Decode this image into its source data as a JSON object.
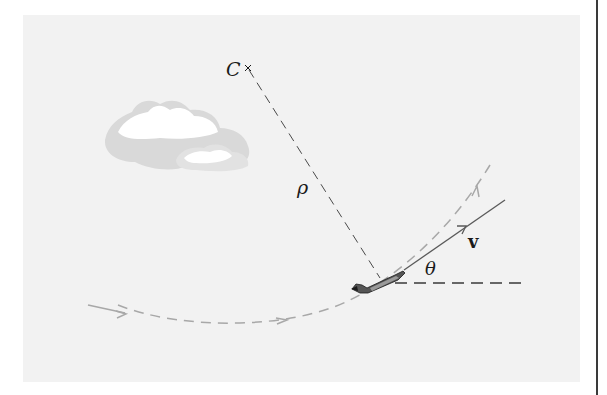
{
  "figure": {
    "labels": {
      "center": "C",
      "radius": "ρ",
      "velocity": "v",
      "angle": "θ"
    },
    "colors": {
      "panel": "#f2f2f2",
      "ink": "#1a1a1a",
      "path": "#a8a8a8",
      "cloud_shadow": "#d9d9d9",
      "cloud": "#ffffff",
      "rule": "#3a3a3a"
    },
    "icons": [
      "airplane-icon",
      "cloud-icon",
      "center-cross-icon",
      "arrow-icon"
    ]
  }
}
